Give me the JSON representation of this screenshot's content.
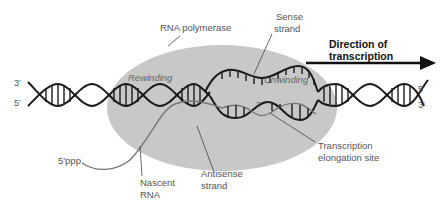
{
  "labels": {
    "rna_polymerase": "RNA polymerase",
    "sense_strand_1": "Sense",
    "sense_strand_2": "strand",
    "direction_1": "Direction of",
    "direction_2": "transcription",
    "rewinding": "Rewinding",
    "unwinding": "Unwinding",
    "five_ppp": "5′ppp",
    "nascent_rna_1": "Nascent",
    "nascent_rna_2": "RNA",
    "antisense_1": "Antisense",
    "antisense_2": "strand",
    "elongation_1": "Transcription",
    "elongation_2": "elongation site",
    "rna_3prime": "3′"
  },
  "ends": {
    "left_top": "3′",
    "left_bottom": "5′",
    "right_top": "5′",
    "right_bottom": "3′"
  },
  "colors": {
    "polymerase": "#c8c8c8",
    "dna": "#1a1a1a",
    "rna": "#777777",
    "arrow": "#111111"
  }
}
